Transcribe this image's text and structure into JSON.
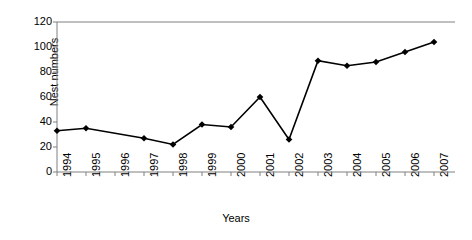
{
  "chart_data": {
    "type": "line",
    "title": "",
    "xlabel": "Years",
    "ylabel": "Nest numbers",
    "categories": [
      "1994",
      "1995",
      "1996",
      "1997",
      "1998",
      "1999",
      "2000",
      "2001",
      "2002",
      "2003",
      "2004",
      "2005",
      "2006",
      "2007"
    ],
    "values": [
      33,
      35,
      null,
      27,
      22,
      38,
      36,
      60,
      26,
      89,
      85,
      88,
      96,
      104
    ],
    "series": [
      {
        "name": "Nest numbers",
        "values": [
          33,
          35,
          null,
          27,
          22,
          38,
          36,
          60,
          26,
          89,
          85,
          88,
          96,
          104
        ],
        "marker": "diamond",
        "color": "#000000"
      }
    ],
    "xlim": [
      0,
      13
    ],
    "ylim": [
      0,
      120
    ],
    "yticks": [
      0,
      20,
      40,
      60,
      80,
      100,
      120
    ],
    "ytick_labels": [
      "0",
      "20",
      "40",
      "60",
      "80",
      "100",
      "120"
    ],
    "xtick_labels": [
      "1994",
      "1995",
      "1996",
      "1997",
      "1998",
      "1999",
      "2000",
      "2001",
      "2002",
      "2003",
      "2004",
      "2005",
      "2006",
      "2007"
    ],
    "grid": false,
    "legend": false,
    "legend_position": "none",
    "axis_color": "#808080",
    "line_color": "#000000",
    "background": "#ffffff"
  }
}
